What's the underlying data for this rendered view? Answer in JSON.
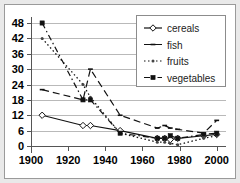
{
  "chart_data": {
    "type": "line",
    "title": "",
    "xlabel": "",
    "ylabel": "",
    "xlim": [
      1900,
      2005
    ],
    "ylim": [
      0,
      48
    ],
    "xticks": [
      1900,
      1920,
      1940,
      1960,
      1980,
      2000
    ],
    "yticks": [
      0,
      6,
      12,
      18,
      24,
      30,
      36,
      42,
      48
    ],
    "grid": true,
    "legend_position": "top-right",
    "series": [
      {
        "name": "cereals",
        "marker": "open-diamond",
        "dash": "solid",
        "x": [
          1906,
          1928,
          1932,
          1948,
          1968,
          1972,
          1975,
          1979,
          1993,
          2000
        ],
        "y": [
          12,
          8,
          8,
          6,
          3,
          3,
          2.5,
          3,
          4,
          4.5
        ]
      },
      {
        "name": "fish",
        "marker": "small-dash",
        "dash": "dashed",
        "x": [
          1906,
          1928,
          1932,
          1948,
          1968,
          1972,
          1975,
          1979,
          1993,
          2000
        ],
        "y": [
          22,
          18,
          30,
          12,
          7,
          8,
          7,
          6.5,
          5,
          10
        ]
      },
      {
        "name": "fruits",
        "marker": "dotted-point",
        "dash": "dotted",
        "x": [
          1906,
          1928,
          1932,
          1948,
          1968,
          1972,
          1975,
          1979,
          1993,
          2000
        ],
        "y": [
          42,
          24,
          19,
          5,
          1.5,
          1.5,
          1,
          0.5,
          3,
          4
        ]
      },
      {
        "name": "vegetables",
        "marker": "filled-square",
        "dash": "dashdot",
        "x": [
          1906,
          1928,
          1932,
          1948,
          1968,
          1972,
          1975,
          1979,
          1993,
          2000
        ],
        "y": [
          48,
          18,
          18,
          5,
          3,
          3,
          4,
          3,
          4.5,
          5
        ]
      }
    ]
  },
  "legend": {
    "items": [
      {
        "label": "cereals"
      },
      {
        "label": "fish"
      },
      {
        "label": "fruits"
      },
      {
        "label": "vegetables"
      }
    ]
  },
  "axes": {
    "x_tick_labels": [
      "1900",
      "1920",
      "1940",
      "1960",
      "1980",
      "2000"
    ],
    "y_tick_labels": [
      "0",
      "6",
      "12",
      "18",
      "24",
      "30",
      "36",
      "42",
      "48"
    ]
  },
  "colors": {
    "line": "#111111",
    "grid": "#b9b9b9",
    "axis": "#555555",
    "background": "#ffffff",
    "page_background": "#e9e9e9"
  }
}
